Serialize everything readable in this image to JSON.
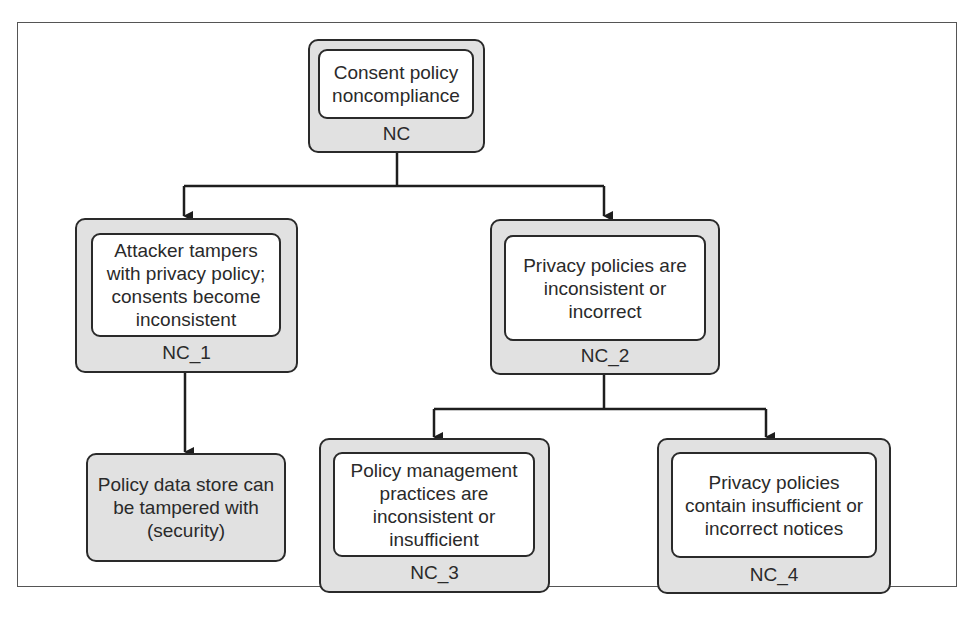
{
  "figure": {
    "caption_top_fragment": "policy is completely...",
    "caption_bottom_fragment": ""
  },
  "tree": {
    "root": {
      "id": "NC",
      "label": "Consent policy noncompliance"
    },
    "nc1": {
      "id": "NC_1",
      "label": "Attacker tampers with privacy policy; consents become inconsistent"
    },
    "nc2": {
      "id": "NC_2",
      "label": "Privacy policies are inconsistent or incorrect"
    },
    "leaf_security": {
      "label": "Policy data store can be tampered with (security)"
    },
    "nc3": {
      "id": "NC_3",
      "label": "Policy management practices are inconsistent or insufficient"
    },
    "nc4": {
      "id": "NC_4",
      "label": "Privacy policies contain insufficient or incorrect notices"
    }
  },
  "edges": [
    {
      "from": "NC",
      "to": "NC_1"
    },
    {
      "from": "NC",
      "to": "NC_2"
    },
    {
      "from": "NC_1",
      "to": "Policy data store can be tampered with (security)"
    },
    {
      "from": "NC_2",
      "to": "NC_3"
    },
    {
      "from": "NC_2",
      "to": "NC_4"
    }
  ],
  "colors": {
    "node_fill": "#e1e1e1",
    "inner_fill": "#ffffff",
    "stroke": "#2a2a2a"
  }
}
